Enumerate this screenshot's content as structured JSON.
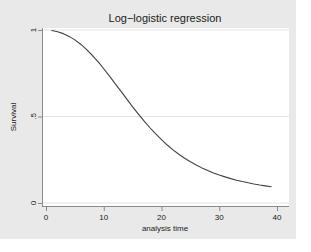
{
  "chart_data": {
    "type": "line",
    "title": "Log−logistic regression",
    "xlabel": "analysis time",
    "ylabel": "Survival",
    "xlim": [
      0,
      40
    ],
    "ylim": [
      0,
      1
    ],
    "xticks": [
      "0",
      "10",
      "20",
      "30",
      "40"
    ],
    "xtick_values": [
      0,
      10,
      20,
      30,
      40
    ],
    "yticks": [
      "0",
      ".5",
      "1"
    ],
    "ytick_values": [
      0,
      0.5,
      1
    ],
    "grid": "horizontal",
    "legend": "none",
    "series": [
      {
        "name": "Survival",
        "x": [
          1,
          2,
          3,
          4,
          5,
          6,
          7,
          8,
          9,
          10,
          11,
          12,
          13,
          14,
          15,
          16,
          17,
          18,
          19,
          20,
          21,
          22,
          23,
          24,
          25,
          26,
          27,
          28,
          29,
          30,
          31,
          32,
          33,
          34,
          35,
          36,
          37,
          38,
          39
        ],
        "y": [
          0.997,
          0.99,
          0.979,
          0.963,
          0.943,
          0.918,
          0.888,
          0.854,
          0.817,
          0.776,
          0.733,
          0.689,
          0.645,
          0.6,
          0.556,
          0.514,
          0.473,
          0.435,
          0.399,
          0.366,
          0.335,
          0.307,
          0.282,
          0.259,
          0.238,
          0.22,
          0.203,
          0.188,
          0.174,
          0.162,
          0.151,
          0.141,
          0.132,
          0.124,
          0.117,
          0.11,
          0.104,
          0.099,
          0.094
        ]
      }
    ]
  },
  "colors": {
    "figure_background": "#e9e9e9",
    "plot_background": "#ffffff",
    "curve": "#404040",
    "axis": "#8a8a8a",
    "grid": "#e0e0e0",
    "text": "#1a1a1a"
  }
}
